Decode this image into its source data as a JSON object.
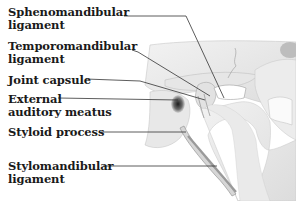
{
  "figure": {
    "labels": [
      {
        "id": "sphenomandibular-ligament",
        "line1": "Sphenomandibular",
        "line2": "ligament"
      },
      {
        "id": "temporomandibular-ligament",
        "line1": "Temporomandibular",
        "line2": "ligament"
      },
      {
        "id": "joint-capsule",
        "line1": "Joint capsule",
        "line2": ""
      },
      {
        "id": "external-auditory-meatus",
        "line1": "External",
        "line2": "auditory meatus"
      },
      {
        "id": "styloid-process",
        "line1": "Styloid process",
        "line2": ""
      },
      {
        "id": "stylomandibular-ligament",
        "line1": "Stylomandibular",
        "line2": "ligament"
      }
    ]
  },
  "colors": {
    "text": "#1a1a1a",
    "leader": "#333333",
    "background": "#ffffff"
  }
}
